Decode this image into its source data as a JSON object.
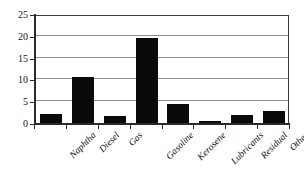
{
  "chart_data": {
    "type": "bar",
    "title": "",
    "subtitle": "",
    "xlabel": "",
    "ylabel": "",
    "categories": [
      "Naphtha",
      "Diesel",
      "Gas",
      "Gasoline",
      "Kerosene",
      "Lubricants",
      "Residual",
      "Other"
    ],
    "values": [
      2.1,
      10.5,
      1.6,
      19.4,
      4.3,
      0.5,
      1.8,
      2.8
    ],
    "ylim": [
      0,
      25
    ],
    "ytick_labels": [
      "0",
      "5",
      "10",
      "15",
      "20",
      "25"
    ],
    "ytick_values": [
      0,
      5,
      10,
      15,
      20,
      25
    ],
    "grid": true,
    "legend": "none",
    "bar_color": "#0a0a0a",
    "axis_color": "#2b2b2b",
    "gridline_color": "#8c8c8c",
    "background_color": "#ffffff"
  }
}
